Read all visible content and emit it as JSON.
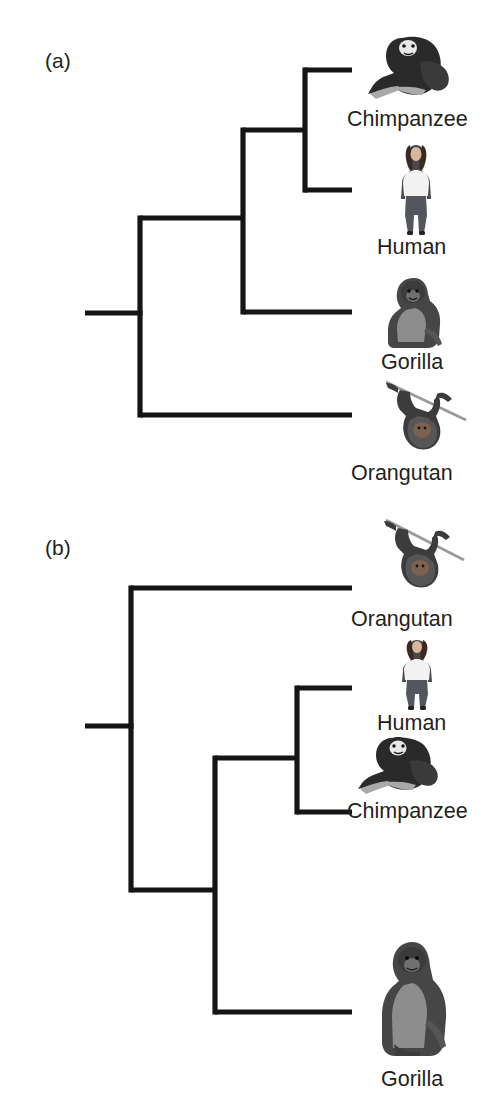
{
  "figure": {
    "type": "cladogram-pair",
    "background": "#ffffff",
    "line_color": "#151515",
    "text_color": "#231f20"
  },
  "panels": [
    {
      "id": "a",
      "label": "(a)",
      "label_pos": {
        "x": 45,
        "y": 50
      },
      "topology": "(((Chimpanzee,Human),Gorilla),Orangutan)",
      "root_stem": {
        "x1": 85,
        "x2": 140,
        "y": 313
      },
      "tip_x": 352,
      "nodes": [
        {
          "name": "root",
          "x": 140,
          "y_top": 218,
          "y_bottom": 415
        },
        {
          "name": "african-ape-clade",
          "x": 243,
          "y_top": 130,
          "y_bottom": 312
        },
        {
          "name": "chimp-human-clade",
          "x": 305,
          "y_top": 70,
          "y_bottom": 190
        }
      ],
      "branches": [
        {
          "name": "node-root-to-african",
          "x1": 140,
          "x2": 243,
          "y": 218
        },
        {
          "name": "node-african-to-chimphuman",
          "x1": 243,
          "x2": 305,
          "y": 130
        },
        {
          "name": "tip-chimpanzee",
          "x1": 305,
          "x2": 352,
          "y": 70
        },
        {
          "name": "tip-human",
          "x1": 305,
          "x2": 352,
          "y": 190
        },
        {
          "name": "tip-gorilla",
          "x1": 243,
          "x2": 352,
          "y": 312
        },
        {
          "name": "tip-orangutan",
          "x1": 140,
          "x2": 352,
          "y": 415
        }
      ],
      "taxa": [
        {
          "name": "chimpanzee",
          "label": "Chimpanzee",
          "icon": "chimpanzee-icon",
          "label_pos": {
            "x": 347,
            "y": 108
          },
          "img_box": {
            "x": 368,
            "y": 32,
            "w": 84,
            "h": 72
          }
        },
        {
          "name": "human",
          "label": "Human",
          "icon": "human-icon",
          "label_pos": {
            "x": 377,
            "y": 236
          },
          "img_box": {
            "x": 396,
            "y": 143,
            "w": 40,
            "h": 92
          }
        },
        {
          "name": "gorilla",
          "label": "Gorilla",
          "icon": "gorilla-icon",
          "label_pos": {
            "x": 381,
            "y": 351
          },
          "img_box": {
            "x": 384,
            "y": 276,
            "w": 62,
            "h": 74
          }
        },
        {
          "name": "orangutan",
          "label": "Orangutan",
          "icon": "orangutan-icon",
          "label_pos": {
            "x": 351,
            "y": 462
          },
          "img_box": {
            "x": 382,
            "y": 380,
            "w": 86,
            "h": 72
          }
        }
      ]
    },
    {
      "id": "b",
      "label": "(b)",
      "label_pos": {
        "x": 45,
        "y": 537
      },
      "topology": "(Orangutan,((Human,Chimpanzee),Gorilla))",
      "root_stem": {
        "x1": 85,
        "x2": 131,
        "y": 726
      },
      "tip_x": 352,
      "nodes": [
        {
          "name": "root",
          "x": 131,
          "y_top": 588,
          "y_bottom": 890
        },
        {
          "name": "african-ape-clade",
          "x": 215,
          "y_top": 758,
          "y_bottom": 1012
        },
        {
          "name": "human-chimp-clade",
          "x": 297,
          "y_top": 688,
          "y_bottom": 812
        }
      ],
      "branches": [
        {
          "name": "tip-orangutan",
          "x1": 131,
          "x2": 352,
          "y": 588
        },
        {
          "name": "node-root-to-african",
          "x1": 131,
          "x2": 215,
          "y": 890
        },
        {
          "name": "node-african-to-humanchimp",
          "x1": 215,
          "x2": 297,
          "y": 758
        },
        {
          "name": "tip-human",
          "x1": 297,
          "x2": 352,
          "y": 688
        },
        {
          "name": "tip-chimpanzee",
          "x1": 297,
          "x2": 352,
          "y": 812
        },
        {
          "name": "tip-gorilla",
          "x1": 215,
          "x2": 352,
          "y": 1012
        }
      ],
      "taxa": [
        {
          "name": "orangutan",
          "label": "Orangutan",
          "icon": "orangutan-icon",
          "label_pos": {
            "x": 351,
            "y": 608
          },
          "img_box": {
            "x": 372,
            "y": 518,
            "w": 94,
            "h": 72
          }
        },
        {
          "name": "human",
          "label": "Human",
          "icon": "human-icon",
          "label_pos": {
            "x": 377,
            "y": 712
          },
          "img_box": {
            "x": 398,
            "y": 638,
            "w": 38,
            "h": 72
          }
        },
        {
          "name": "chimpanzee",
          "label": "Chimpanzee",
          "icon": "chimpanzee-icon",
          "label_pos": {
            "x": 347,
            "y": 800
          },
          "img_box": {
            "x": 358,
            "y": 734,
            "w": 82,
            "h": 64
          }
        },
        {
          "name": "gorilla",
          "label": "Gorilla",
          "icon": "gorilla-icon",
          "label_pos": {
            "x": 381,
            "y": 1068
          },
          "img_box": {
            "x": 378,
            "y": 938,
            "w": 72,
            "h": 122
          }
        }
      ]
    }
  ]
}
